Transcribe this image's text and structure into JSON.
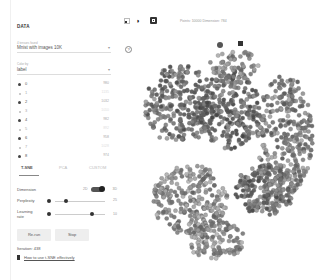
{
  "sidebar": {
    "section_title": "DATA",
    "tensor_label": "4 tensors found",
    "tensor_value": "Mnist with images 10K",
    "color_by_label": "Color by",
    "color_by_value": "label",
    "labels": [
      {
        "name": "0",
        "count": "980",
        "dark": true
      },
      {
        "name": "1",
        "count": "1135",
        "dark": false
      },
      {
        "name": "2",
        "count": "1032",
        "dark": true
      },
      {
        "name": "3",
        "count": "1010",
        "dark": false
      },
      {
        "name": "4",
        "count": "982",
        "dark": true
      },
      {
        "name": "5",
        "count": "892",
        "dark": false
      },
      {
        "name": "6",
        "count": "958",
        "dark": true
      },
      {
        "name": "7",
        "count": "1028",
        "dark": false
      },
      {
        "name": "8",
        "count": "974",
        "dark": true
      }
    ]
  },
  "tabs": [
    {
      "label": "T-SNE",
      "active": true
    },
    {
      "label": "PCA",
      "active": false
    },
    {
      "label": "CUSTOM",
      "active": false
    }
  ],
  "tsne": {
    "dimension_label": "Dimension",
    "dimension_2d": "2D",
    "dimension_3d": "3D",
    "perplexity_label": "Perplexity",
    "perplexity_value": "25",
    "learning_rate_label": "Learning rate",
    "learning_rate_value": "10",
    "rerun_label": "Re-run",
    "stop_label": "Stop",
    "iteration_text": "Iteration: 438",
    "help_link": "How to use t-SNE effectively"
  },
  "toolbar": {
    "status_text": "Points: 10000  Dimension: 784",
    "icons": [
      "select-icon",
      "night-mode-icon",
      "label-icon"
    ]
  },
  "plot": {
    "clusters": [
      {
        "cx": 45,
        "cy": 70,
        "rx": 36,
        "ry": 40,
        "n": 260,
        "shade": 0.45
      },
      {
        "cx": 95,
        "cy": 75,
        "rx": 30,
        "ry": 40,
        "n": 240,
        "shade": 0.42
      },
      {
        "cx": 150,
        "cy": 100,
        "rx": 28,
        "ry": 60,
        "n": 300,
        "shade": 0.5
      },
      {
        "cx": 100,
        "cy": 30,
        "rx": 25,
        "ry": 15,
        "n": 60,
        "shade": 0.55
      },
      {
        "cx": 55,
        "cy": 165,
        "rx": 38,
        "ry": 35,
        "n": 260,
        "shade": 0.55
      },
      {
        "cx": 130,
        "cy": 155,
        "rx": 30,
        "ry": 25,
        "n": 200,
        "shade": 0.45
      },
      {
        "cx": 80,
        "cy": 205,
        "rx": 30,
        "ry": 20,
        "n": 120,
        "shade": 0.55
      }
    ]
  }
}
